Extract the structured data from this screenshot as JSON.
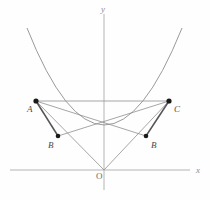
{
  "figure": {
    "background_color": "#fefefe",
    "width": 209,
    "height": 200
  },
  "colors": {
    "axis": "#b4b4b4",
    "curve": "#9a9a9a",
    "thin_line": "#8f8f8f",
    "thick_line": "#555555",
    "point_fill": "#1a1a1a",
    "label_text": "#4a4a4a",
    "axis_label_text": "#8e8e8e"
  },
  "axes": {
    "x_axis": {
      "label": "x",
      "label_position": {
        "x": 196,
        "y": 171
      },
      "line": {
        "x1": 10,
        "y1": 170,
        "x2": 190,
        "y2": 170
      }
    },
    "y_axis": {
      "label": "y",
      "label_position": {
        "x": 104,
        "y": 9
      },
      "line": {
        "x1": 104,
        "y1": 14,
        "x2": 104,
        "y2": 190
      }
    },
    "origin": {
      "label": "O",
      "label_position": {
        "x": 98,
        "y": 176
      },
      "point": {
        "x": 104,
        "y": 170
      }
    }
  },
  "curve": {
    "type": "parabola",
    "orientation": "opens-upward",
    "vertex": {
      "x": 104,
      "y": 170
    },
    "path": "M 27 28 Q 104 222 182 28",
    "left_endpoint": {
      "x": 27,
      "y": 28
    },
    "right_endpoint": {
      "x": 182,
      "y": 28
    }
  },
  "points": [
    {
      "name": "A",
      "label": "A",
      "x": 36,
      "y": 101,
      "label_x": 27,
      "label_y": 105,
      "radius": 2.6
    },
    {
      "name": "C",
      "label": "C",
      "x": 169,
      "y": 101,
      "label_x": 174,
      "label_y": 105,
      "radius": 2.6
    },
    {
      "name": "B-left",
      "label": "B",
      "x": 58,
      "y": 136,
      "label_x": 48,
      "label_y": 141,
      "radius": 2.3
    },
    {
      "name": "B-right",
      "label": "B",
      "x": 146,
      "y": 136,
      "label_x": 151,
      "label_y": 141,
      "radius": 2.3
    }
  ],
  "segments": [
    {
      "name": "chord-A-C",
      "x1": 36,
      "y1": 101,
      "x2": 169,
      "y2": 101,
      "weight": "thin"
    },
    {
      "name": "line-A-to-Bright",
      "x1": 36,
      "y1": 101,
      "x2": 146,
      "y2": 136,
      "weight": "thin"
    },
    {
      "name": "line-C-to-Bleft",
      "x1": 169,
      "y1": 101,
      "x2": 58,
      "y2": 136,
      "weight": "thin"
    },
    {
      "name": "line-A-to-O",
      "x1": 36,
      "y1": 101,
      "x2": 104,
      "y2": 170,
      "weight": "thin"
    },
    {
      "name": "line-C-to-O",
      "x1": 169,
      "y1": 101,
      "x2": 104,
      "y2": 170,
      "weight": "thin"
    },
    {
      "name": "segment-A-Bleft",
      "x1": 36,
      "y1": 101,
      "x2": 58,
      "y2": 136,
      "weight": "thick"
    },
    {
      "name": "segment-C-Bright",
      "x1": 169,
      "y1": 101,
      "x2": 146,
      "y2": 136,
      "weight": "thick"
    },
    {
      "name": "line-Bleft-to-O",
      "x1": 58,
      "y1": 136,
      "x2": 104,
      "y2": 170,
      "weight": "thin"
    },
    {
      "name": "line-Bright-to-O",
      "x1": 146,
      "y1": 136,
      "x2": 104,
      "y2": 170,
      "weight": "thin"
    }
  ],
  "intersection": {
    "name": "center-crossing",
    "x": 104,
    "y": 124
  }
}
